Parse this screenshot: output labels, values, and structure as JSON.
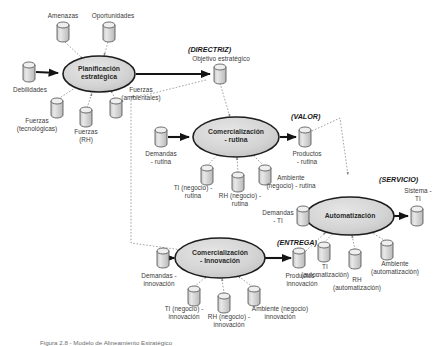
{
  "figure": {
    "caption": "Figura 2.8 - Modelo de Alineamiento Estratégico",
    "language": "es"
  },
  "colors": {
    "cylinder_fill": "#d8d8d8",
    "cylinder_top": "#eceaea",
    "cylinder_stroke": "#4a4a4a",
    "ellipse_fill": "#d5d5d5",
    "ellipse_stroke": "#1d1d1d",
    "solid_arrow": "#141414",
    "dotted_line": "#8b8b8b",
    "text": "#3a3a3a",
    "tag_text": "#181818",
    "background": "#ffffff"
  },
  "processes": [
    {
      "id": "planificacion",
      "label": "Planificación\nestratégica",
      "cx": 99,
      "cy": 74,
      "rx": 36,
      "ry": 18
    },
    {
      "id": "comercializacion_rutina",
      "label": "Comercialización\n- rutina",
      "cx": 236,
      "cy": 137,
      "rx": 43,
      "ry": 20
    },
    {
      "id": "comercializacion_innovacion",
      "label": "Comercialización\n- Innovación",
      "cx": 220,
      "cy": 258,
      "rx": 45,
      "ry": 20
    },
    {
      "id": "automatizacion",
      "label": "Automatización",
      "cx": 350,
      "cy": 216,
      "rx": 44,
      "ry": 19
    }
  ],
  "tags": [
    {
      "id": "directriz",
      "label": "(DIRECTRIZ)",
      "x": 188,
      "y": 46
    },
    {
      "id": "valor",
      "label": "(VALOR)",
      "x": 291,
      "y": 113
    },
    {
      "id": "servicio",
      "label": "(SERVICIO)",
      "x": 379,
      "y": 176
    },
    {
      "id": "entrega",
      "label": "(ENTREGA)",
      "x": 277,
      "y": 239
    }
  ],
  "entities": [
    {
      "id": "amenazas",
      "label": "Amenazas",
      "cx": 63,
      "cy": 32,
      "label_x": 63,
      "label_y": 13,
      "role": "input"
    },
    {
      "id": "oportunidades",
      "label": "Oportunidades",
      "cx": 109,
      "cy": 32,
      "label_x": 112,
      "label_y": 13,
      "role": "input"
    },
    {
      "id": "debilidades",
      "label": "Debilidades",
      "cx": 29,
      "cy": 72,
      "label_x": 29,
      "label_y": 88,
      "role": "input"
    },
    {
      "id": "fuerzas_tecnologicas",
      "label": "Fuerzas\n(tecnológicas)",
      "cx": 57,
      "cy": 108,
      "label_x": 36,
      "label_y": 120,
      "role": "input"
    },
    {
      "id": "fuerzas_rh",
      "label": "Fuerzas\n(RH)",
      "cx": 86,
      "cy": 117,
      "label_x": 86,
      "label_y": 129,
      "role": "input"
    },
    {
      "id": "fuerzas_ambientales",
      "label": "Fuerzas\n(ambientales)",
      "cx": 116,
      "cy": 108,
      "label_x": 140,
      "label_y": 90,
      "role": "input"
    },
    {
      "id": "objetivo_estrategico",
      "label": "Objetivo estratégico",
      "cx": 220,
      "cy": 74,
      "label_x": 220,
      "label_y": 56,
      "role": "output"
    },
    {
      "id": "demandas_rutina",
      "label": "Demandas\n- rutina",
      "cx": 161,
      "cy": 137,
      "label_x": 161,
      "label_y": 152,
      "role": "input"
    },
    {
      "id": "ti_negocio_rutina",
      "label": "TI (negocio) -\nrutina",
      "cx": 207,
      "cy": 175,
      "label_x": 192,
      "label_y": 186,
      "role": "input"
    },
    {
      "id": "rh_negocio_rutina",
      "label": "RH (negocio) -\nrutina",
      "cx": 238,
      "cy": 182,
      "label_x": 238,
      "label_y": 194,
      "role": "input"
    },
    {
      "id": "ambiente_negocio_rutina",
      "label": "Ambiente\n(negocio) - rutina",
      "cx": 265,
      "cy": 175,
      "label_x": 290,
      "label_y": 178,
      "role": "input"
    },
    {
      "id": "productos_rutina",
      "label": "Productos\n- rutina",
      "cx": 305,
      "cy": 137,
      "label_x": 307,
      "label_y": 152,
      "role": "output"
    },
    {
      "id": "demandas_ti",
      "label": "Demandas\n- TI",
      "cx": 303,
      "cy": 216,
      "label_x": 280,
      "label_y": 211,
      "role": "input"
    },
    {
      "id": "sistema_ti",
      "label": "Sistema -\nTI",
      "cx": 417,
      "cy": 216,
      "label_x": 417,
      "label_y": 190,
      "role": "output"
    },
    {
      "id": "ti_automatizacion",
      "label": "TI\n(automatización)",
      "cx": 324,
      "cy": 252,
      "label_x": 325,
      "label_y": 264,
      "role": "input"
    },
    {
      "id": "rh_automatizacion",
      "label": "RH\n(automatización)",
      "cx": 355,
      "cy": 259,
      "label_x": 356,
      "label_y": 271,
      "role": "input"
    },
    {
      "id": "ambiente_automatizacion",
      "label": "Ambiente\n(automatización)",
      "cx": 387,
      "cy": 250,
      "label_x": 393,
      "label_y": 262,
      "role": "input"
    },
    {
      "id": "demandas_innovacion",
      "label": "Demandas -\ninnovación",
      "cx": 163,
      "cy": 258,
      "label_x": 157,
      "label_y": 273,
      "role": "input"
    },
    {
      "id": "ti_negocio_innovacion",
      "label": "TI (negocio) -\ninnovación",
      "cx": 194,
      "cy": 296,
      "label_x": 184,
      "label_y": 307,
      "role": "input"
    },
    {
      "id": "rh_negocio_innovacion",
      "label": "RH (negocio) -\ninnovación",
      "cx": 224,
      "cy": 303,
      "label_x": 228,
      "label_y": 315,
      "role": "input"
    },
    {
      "id": "ambiente_negocio_innovacion",
      "label": "Ambiente (negocio)\ninnovación",
      "cx": 254,
      "cy": 296,
      "label_x": 277,
      "label_y": 307,
      "role": "input"
    },
    {
      "id": "productos_innovacion",
      "label": "Productos -\ninnovación",
      "cx": 299,
      "cy": 258,
      "label_x": 300,
      "label_y": 274,
      "role": "output"
    }
  ],
  "flows": {
    "solid": [
      {
        "from": "debilidades",
        "to": "planificacion"
      },
      {
        "from": "planificacion",
        "to": "objetivo_estrategico"
      },
      {
        "from": "demandas_rutina",
        "to": "comercializacion_rutina"
      },
      {
        "from": "comercializacion_rutina",
        "to": "productos_rutina"
      },
      {
        "from": "demandas_ti",
        "to": "automatizacion"
      },
      {
        "from": "automatizacion",
        "to": "sistema_ti"
      },
      {
        "from": "demandas_innovacion",
        "to": "comercializacion_innovacion"
      },
      {
        "from": "comercializacion_innovacion",
        "to": "productos_innovacion"
      }
    ],
    "dotted": [
      {
        "from": "amenazas",
        "to": "planificacion"
      },
      {
        "from": "oportunidades",
        "to": "planificacion"
      },
      {
        "from": "fuerzas_tecnologicas",
        "to": "planificacion"
      },
      {
        "from": "fuerzas_rh",
        "to": "planificacion"
      },
      {
        "from": "fuerzas_ambientales",
        "to": "planificacion"
      },
      {
        "from": "objetivo_estrategico",
        "to": "comercializacion_rutina"
      },
      {
        "from": "objetivo_estrategico",
        "to": "comercializacion_innovacion"
      },
      {
        "from": "ti_negocio_rutina",
        "to": "comercializacion_rutina"
      },
      {
        "from": "rh_negocio_rutina",
        "to": "comercializacion_rutina"
      },
      {
        "from": "ambiente_negocio_rutina",
        "to": "comercializacion_rutina"
      },
      {
        "from": "productos_rutina",
        "to": "automatizacion"
      },
      {
        "from": "ti_automatizacion",
        "to": "automatizacion"
      },
      {
        "from": "rh_automatizacion",
        "to": "automatizacion"
      },
      {
        "from": "ambiente_automatizacion",
        "to": "automatizacion"
      },
      {
        "from": "ti_negocio_innovacion",
        "to": "comercializacion_innovacion"
      },
      {
        "from": "rh_negocio_innovacion",
        "to": "comercializacion_innovacion"
      },
      {
        "from": "ambiente_negocio_innovacion",
        "to": "comercializacion_innovacion"
      },
      {
        "from": "productos_innovacion",
        "to": "automatizacion"
      }
    ]
  }
}
